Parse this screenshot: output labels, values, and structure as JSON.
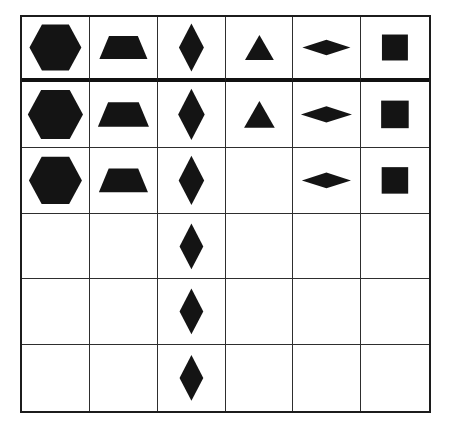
{
  "page": {
    "background_color": "#ffffff"
  },
  "board": {
    "columns": 6,
    "rows": 6,
    "border_color": "#1c1c1c",
    "grid_line_color": "#2e2e2e",
    "header_separator_color": "#111111",
    "shape_color": "#141414",
    "row_scales": [
      1.04,
      1.04,
      1.0,
      0.93,
      0.93,
      0.93
    ],
    "cells": [
      [
        "hexagon",
        "trapezoid",
        "diamond",
        "triangle",
        "flat-diamond",
        "square"
      ],
      [
        "hexagon",
        "trapezoid",
        "diamond",
        "triangle",
        "flat-diamond",
        "square"
      ],
      [
        "hexagon",
        "trapezoid",
        "diamond",
        null,
        "flat-diamond",
        "square"
      ],
      [
        null,
        null,
        "diamond",
        null,
        null,
        null
      ],
      [
        null,
        null,
        "diamond",
        null,
        null,
        null
      ],
      [
        null,
        null,
        "diamond",
        null,
        null,
        null
      ]
    ],
    "shape_counts": {
      "hexagon": 3,
      "trapezoid": 3,
      "diamond": 6,
      "triangle": 2,
      "flat-diamond": 3,
      "square": 3
    }
  },
  "shapes": {
    "hexagon": {
      "kind": "polygon",
      "points": "7,33 20,9 48,9 61,33 48,57 20,57"
    },
    "trapezoid": {
      "kind": "polygon",
      "points": "19,21 49,21 59,45 9,45"
    },
    "diamond": {
      "kind": "polygon",
      "points": "34,8 47,33 34,58 21,33"
    },
    "triangle": {
      "kind": "polygon",
      "points": "34,20 49,46 19,46"
    },
    "flat-diamond": {
      "kind": "polygon",
      "points": "9,33 34,25 59,33 34,41"
    },
    "square": {
      "kind": "rect",
      "x": 20.5,
      "y": 19.5,
      "w": 27,
      "h": 27
    }
  }
}
